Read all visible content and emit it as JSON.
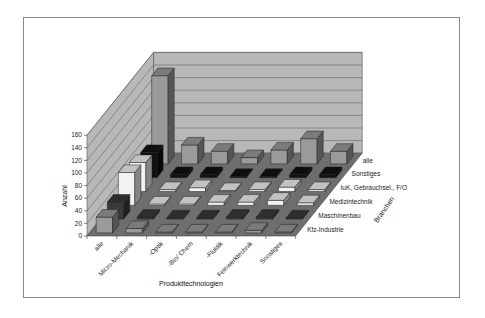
{
  "chart_data": {
    "type": "bar3d",
    "title": "",
    "xlabel": "Produkttechnologien",
    "ylabel": "Anzahl",
    "zlabel": "Branchen",
    "ylim": [
      0,
      160
    ],
    "yticks": [
      0,
      20,
      40,
      60,
      80,
      100,
      120,
      140,
      160
    ],
    "grid": true,
    "categories": [
      "alle",
      "Micro-Mechanik",
      "Optik",
      "Bio/ Chem",
      "Fluidik",
      "Feinwerktechnik",
      "Sonstiges"
    ],
    "series": [
      {
        "name": "Kfz-Industrie",
        "color": "#9a9a9a",
        "values": [
          25,
          7,
          0,
          0,
          1,
          4,
          1
        ]
      },
      {
        "name": "Maschinenbau",
        "color": "#3a3a3a",
        "values": [
          27,
          3,
          2,
          2,
          3,
          3,
          2
        ]
      },
      {
        "name": "Medizintechnik",
        "color": "#f2f2f2",
        "values": [
          52,
          2,
          2,
          5,
          5,
          8,
          4
        ]
      },
      {
        "name": "IuK, Gebrauchsel., F/O",
        "color": "#f2f2f2",
        "values": [
          46,
          3,
          6,
          0,
          3,
          7,
          3
        ]
      },
      {
        "name": "Sonstiges",
        "color": "#111111",
        "values": [
          40,
          5,
          5,
          2,
          2,
          5,
          5
        ]
      },
      {
        "name": "alle",
        "color": "#9a9a9a",
        "values": [
          140,
          30,
          20,
          10,
          22,
          40,
          20
        ]
      }
    ]
  },
  "labels": {
    "y_title": "Anzahl",
    "x_title": "Produkttechnologien",
    "z_title": "Branchen",
    "y_ticks": [
      "0",
      "20",
      "40",
      "60",
      "80",
      "100",
      "120",
      "140",
      "160"
    ],
    "x_categories": [
      "alle",
      "Micro-Mechanik",
      "-Optik",
      "-Bio/ Chem",
      "-Fluidik",
      "Feinwerktechnik",
      "Sonstiges"
    ],
    "z_categories": [
      "Kfz-Industrie",
      "Maschinenbau",
      "Medizintechnik",
      "IuK, Gebrauchsel., F/O",
      "Sonstiges",
      "alle"
    ]
  },
  "colors": {
    "floor": "#6e6e6e",
    "wall": "#b8b8b8",
    "gridline": "#555555",
    "frame": "#8a8a8a"
  }
}
